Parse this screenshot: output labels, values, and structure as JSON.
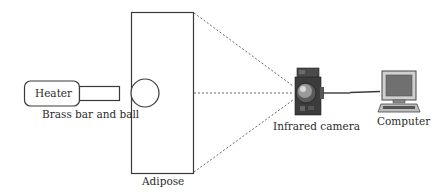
{
  "diagram": {
    "labels": {
      "heater": "Heater",
      "brass": "Brass bar and ball",
      "adipose": "Adipose",
      "camera": "Infrared camera",
      "computer": "Computer"
    },
    "colors": {
      "stroke": "#3a3a3a",
      "dotted": "#666666",
      "camera_body": "#3c3c3c",
      "monitor_screen": "#707070"
    }
  }
}
